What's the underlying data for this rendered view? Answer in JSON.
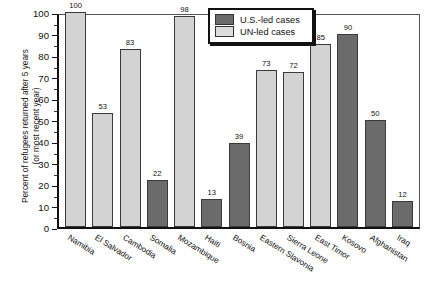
{
  "chart_data": {
    "type": "bar",
    "title": "",
    "xlabel": "",
    "ylabel": "Percent of refugees returned after 5 years (or most recent year)",
    "ylabel_line1": "Percent of refugees returned after 5 years",
    "ylabel_line2": "(or most recent year)",
    "ylim": [
      0,
      100
    ],
    "ytick_step": 10,
    "yminor_step": 5,
    "grid": false,
    "legend_position": "top-center",
    "categories": [
      "Namibia",
      "El Salvador",
      "Cambodia",
      "Somalia",
      "Mozambique",
      "Haiti",
      "Bosnia",
      "Eastern Slavonia",
      "Sierra Leone",
      "East Timor",
      "Kosovo",
      "Afghanistan",
      "Iraq"
    ],
    "values": [
      100,
      53,
      83,
      22,
      98,
      13,
      39,
      73,
      72,
      85,
      90,
      50,
      12
    ],
    "groups": [
      "UN-led",
      "UN-led",
      "UN-led",
      "U.S.-led",
      "UN-led",
      "U.S.-led",
      "U.S.-led",
      "UN-led",
      "UN-led",
      "UN-led",
      "U.S.-led",
      "U.S.-led",
      "U.S.-led"
    ],
    "yticks": [
      "0",
      "10",
      "20",
      "30",
      "40",
      "50",
      "60",
      "70",
      "80",
      "90",
      "100"
    ],
    "series": [
      {
        "name": "U.S.-led cases",
        "color": "#6b6b6b",
        "points": [
          {
            "category": "Somalia",
            "value": 22
          },
          {
            "category": "Haiti",
            "value": 13
          },
          {
            "category": "Bosnia",
            "value": 39
          },
          {
            "category": "Kosovo",
            "value": 90
          },
          {
            "category": "Afghanistan",
            "value": 50
          },
          {
            "category": "Iraq",
            "value": 12
          }
        ]
      },
      {
        "name": "UN-led cases",
        "color": "#d3d3d3",
        "points": [
          {
            "category": "Namibia",
            "value": 100
          },
          {
            "category": "El Salvador",
            "value": 53
          },
          {
            "category": "Cambodia",
            "value": 83
          },
          {
            "category": "Mozambique",
            "value": 98
          },
          {
            "category": "Eastern Slavonia",
            "value": 73
          },
          {
            "category": "Sierra Leone",
            "value": 72
          },
          {
            "category": "East Timor",
            "value": 85
          }
        ]
      }
    ]
  },
  "legend": {
    "items": [
      {
        "label": "U.S.-led cases",
        "swatch": "us"
      },
      {
        "label": "UN-led cases",
        "swatch": "un"
      }
    ]
  },
  "colors": {
    "us_led": "#6b6b6b",
    "un_led": "#d3d3d3",
    "axis": "#111111"
  }
}
